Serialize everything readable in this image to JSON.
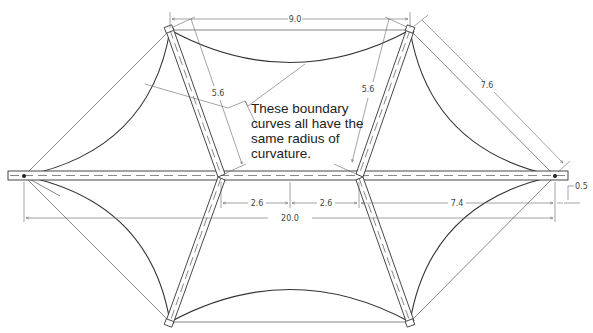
{
  "drawing": {
    "title": "Tensile membrane structure plan with masts and boundary curves",
    "annotation": {
      "lines": [
        "These boundary",
        "curves all have the",
        "same radius of",
        "curvature."
      ]
    },
    "dimensions": {
      "top_span": "9.0",
      "left_mast": "5.6",
      "right_mast": "5.6",
      "diagonal": "7.6",
      "left_offset": "2.6",
      "center_offset": "2.6",
      "right_offset": "7.4",
      "total_span": "20.0",
      "end_offset": "0.5"
    },
    "colors": {
      "line": "#333333",
      "dimension": "#666666",
      "background": "#ffffff"
    }
  }
}
